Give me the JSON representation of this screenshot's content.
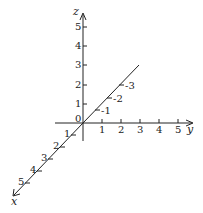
{
  "diagram": {
    "colors": {
      "ink": "#222222",
      "background": "#ffffff"
    },
    "axes": {
      "z": {
        "label": "z",
        "ticks": [
          "0",
          "1",
          "2",
          "3",
          "4",
          "5"
        ]
      },
      "y": {
        "label": "y",
        "ticks": [
          "1",
          "2",
          "3",
          "4",
          "5"
        ]
      },
      "x": {
        "label": "x",
        "ticks": [
          "1",
          "2",
          "3",
          "4",
          "5"
        ]
      },
      "x_negative": {
        "ticks": [
          "-1",
          "-2",
          "-3"
        ]
      }
    }
  }
}
